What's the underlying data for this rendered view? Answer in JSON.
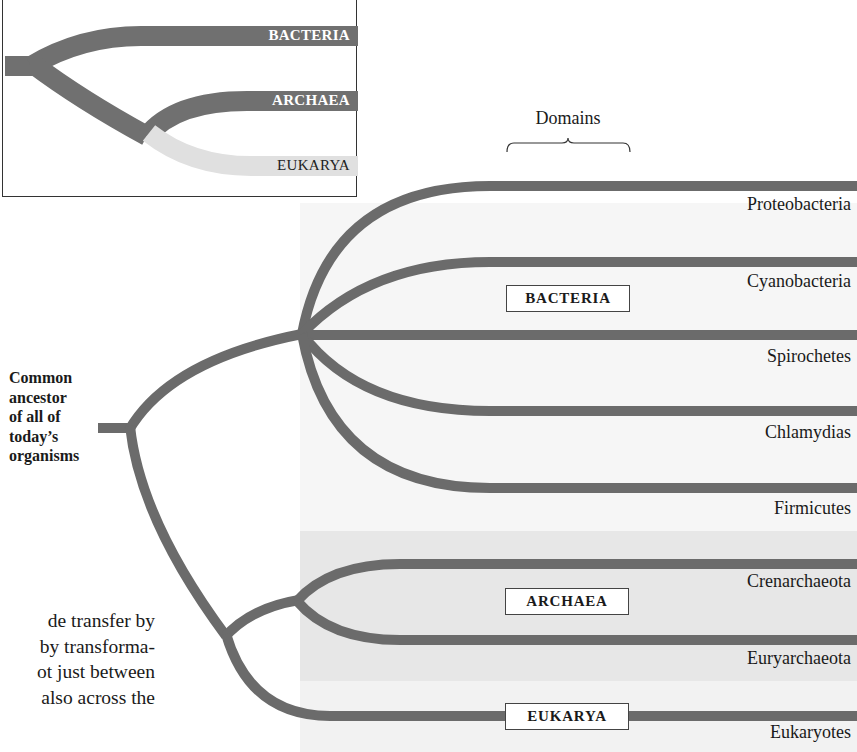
{
  "colors": {
    "branch": "#6b6b6b",
    "bacteria_panel": "#f6f6f6",
    "archaea_panel": "#e7e7e7",
    "eukarya_panel": "#f2f2f2",
    "inset_eukarya_branch": "#e0e0e0"
  },
  "inset": {
    "labels": {
      "bacteria": "BACTERIA",
      "archaea": "ARCHAEA",
      "eukarya": "EUKARYA"
    }
  },
  "diagram": {
    "domains_heading": "Domains",
    "ancestor_label": [
      "Common",
      "ancestor",
      "of all of",
      "today’s",
      "organisms"
    ],
    "domains": [
      {
        "name": "BACTERIA",
        "taxa": [
          "Proteobacteria",
          "Cyanobacteria",
          "Spirochetes",
          "Chlamydias",
          "Firmicutes"
        ]
      },
      {
        "name": "ARCHAEA",
        "taxa": [
          "Crenarchaeota",
          "Euryarchaeota"
        ]
      },
      {
        "name": "EUKARYA",
        "taxa": [
          "Eukaryotes"
        ]
      }
    ]
  },
  "body_text": {
    "lines": [
      "de transfer by",
      "by transforma-",
      "ot just between",
      "also across the"
    ]
  }
}
